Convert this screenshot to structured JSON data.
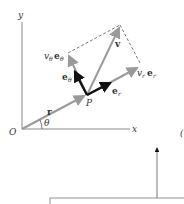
{
  "diagram": {
    "labels": {
      "y_axis": "y",
      "x_axis": "x",
      "origin": "O",
      "point": "P",
      "position_vector": "r",
      "angle": "θ",
      "velocity": "v",
      "radial_unit": "e",
      "radial_unit_sub": "r",
      "transverse_unit": "e",
      "transverse_unit_sub": "θ",
      "radial_component_coef": "v",
      "radial_component_coef_sub": "r",
      "radial_component_vec": "e",
      "radial_component_vec_sub": "r",
      "transverse_component_coef": "v",
      "transverse_component_coef_sub": "θ",
      "transverse_component_vec": "e",
      "transverse_component_vec_sub": "θ",
      "partial_right_label": "("
    },
    "colors": {
      "axis": "#888888",
      "gray_vector": "#9a9a9a",
      "unit_vector": "#111111",
      "dashed": "#555555",
      "text": "#333333"
    }
  }
}
